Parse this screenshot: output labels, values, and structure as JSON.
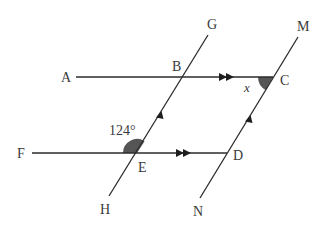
{
  "diagram": {
    "type": "parallel-lines-angle-problem",
    "points": {
      "A": {
        "label": "A",
        "x": 66,
        "y": 77
      },
      "B": {
        "label": "B",
        "x": 183,
        "y": 77
      },
      "C": {
        "label": "C",
        "x": 273,
        "y": 77
      },
      "D": {
        "label": "D",
        "x": 227,
        "y": 153
      },
      "E": {
        "label": "E",
        "x": 137,
        "y": 153
      },
      "F": {
        "label": "F",
        "x": 22,
        "y": 153
      },
      "G": {
        "label": "G",
        "x": 208,
        "y": 35
      },
      "H": {
        "label": "H",
        "x": 109,
        "y": 196
      },
      "M": {
        "label": "M",
        "x": 298,
        "y": 37
      },
      "N": {
        "label": "N",
        "x": 200,
        "y": 198
      }
    },
    "lines": [
      {
        "name": "AC",
        "description": "horizontal line A to C with double arrow (parallel to FD)"
      },
      {
        "name": "FD",
        "description": "horizontal line F to D with double arrow (parallel to AC)"
      },
      {
        "name": "HG",
        "description": "transversal H-E-B-G with single arrow (parallel to NM)"
      },
      {
        "name": "NM",
        "description": "line N-D-C-M with single arrow (parallel to HG)"
      }
    ],
    "angles": {
      "given": {
        "label": "124°",
        "vertex": "E",
        "between": "EF and EB",
        "shaded": true
      },
      "unknown": {
        "label": "x",
        "vertex": "C",
        "between": "CB and CD",
        "shaded": true
      }
    },
    "shade_color": "#555555"
  }
}
